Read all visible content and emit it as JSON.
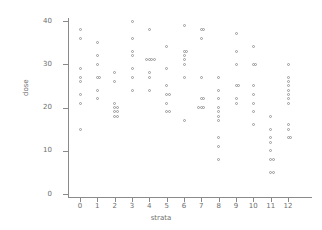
{
  "chart_data": {
    "type": "scatter",
    "title": "",
    "xlabel": "strata",
    "ylabel": "dose",
    "xlim": [
      -0.6,
      12.8
    ],
    "ylim": [
      0,
      42
    ],
    "xticks": [
      0,
      1,
      2,
      3,
      4,
      5,
      6,
      7,
      8,
      9,
      10,
      11,
      12
    ],
    "yticks": [
      0,
      10,
      20,
      30,
      40
    ],
    "xtick_labels": [
      "0",
      "1",
      "2",
      "3",
      "4",
      "5",
      "6",
      "7",
      "8",
      "9",
      "10",
      "11",
      "12"
    ],
    "ytick_labels": [
      "0",
      "10",
      "20",
      "30",
      "40"
    ],
    "grid": false,
    "legend": false,
    "marker": "open-circle",
    "marker_color": "#9a9a9a",
    "axis_color": "#8a8a8a",
    "series": [
      {
        "name": "dose by strata",
        "points": [
          {
            "x": 0,
            "y": 38
          },
          {
            "x": 0,
            "y": 36
          },
          {
            "x": 0,
            "y": 29
          },
          {
            "x": 0,
            "y": 27
          },
          {
            "x": 0,
            "y": 26
          },
          {
            "x": 0,
            "y": 23
          },
          {
            "x": 0,
            "y": 21
          },
          {
            "x": 0,
            "y": 15
          },
          {
            "x": 1,
            "y": 35
          },
          {
            "x": 1,
            "y": 32
          },
          {
            "x": 1,
            "y": 30
          },
          {
            "x": 1,
            "y": 27
          },
          {
            "x": 1,
            "y": 27
          },
          {
            "x": 1,
            "y": 24
          },
          {
            "x": 1,
            "y": 22
          },
          {
            "x": 2,
            "y": 28
          },
          {
            "x": 2,
            "y": 26
          },
          {
            "x": 2,
            "y": 21
          },
          {
            "x": 2,
            "y": 20
          },
          {
            "x": 2,
            "y": 20
          },
          {
            "x": 2,
            "y": 19
          },
          {
            "x": 2,
            "y": 19
          },
          {
            "x": 2,
            "y": 18
          },
          {
            "x": 2,
            "y": 18
          },
          {
            "x": 3,
            "y": 40
          },
          {
            "x": 3,
            "y": 36
          },
          {
            "x": 3,
            "y": 33
          },
          {
            "x": 3,
            "y": 32
          },
          {
            "x": 3,
            "y": 29
          },
          {
            "x": 3,
            "y": 27
          },
          {
            "x": 3,
            "y": 24
          },
          {
            "x": 4,
            "y": 38
          },
          {
            "x": 4,
            "y": 31
          },
          {
            "x": 4,
            "y": 31
          },
          {
            "x": 4,
            "y": 31
          },
          {
            "x": 4,
            "y": 31
          },
          {
            "x": 4,
            "y": 28
          },
          {
            "x": 4,
            "y": 27
          },
          {
            "x": 4,
            "y": 24
          },
          {
            "x": 5,
            "y": 34
          },
          {
            "x": 5,
            "y": 29
          },
          {
            "x": 5,
            "y": 25
          },
          {
            "x": 5,
            "y": 23
          },
          {
            "x": 5,
            "y": 23
          },
          {
            "x": 5,
            "y": 21
          },
          {
            "x": 5,
            "y": 19
          },
          {
            "x": 5,
            "y": 19
          },
          {
            "x": 6,
            "y": 39
          },
          {
            "x": 6,
            "y": 33
          },
          {
            "x": 6,
            "y": 33
          },
          {
            "x": 6,
            "y": 32
          },
          {
            "x": 6,
            "y": 31
          },
          {
            "x": 6,
            "y": 30
          },
          {
            "x": 6,
            "y": 27
          },
          {
            "x": 6,
            "y": 17
          },
          {
            "x": 7,
            "y": 38
          },
          {
            "x": 7,
            "y": 38
          },
          {
            "x": 7,
            "y": 36
          },
          {
            "x": 7,
            "y": 27
          },
          {
            "x": 7,
            "y": 22
          },
          {
            "x": 7,
            "y": 22
          },
          {
            "x": 7,
            "y": 20
          },
          {
            "x": 7,
            "y": 20
          },
          {
            "x": 7,
            "y": 20
          },
          {
            "x": 8,
            "y": 27
          },
          {
            "x": 8,
            "y": 24
          },
          {
            "x": 8,
            "y": 22
          },
          {
            "x": 8,
            "y": 20
          },
          {
            "x": 8,
            "y": 19
          },
          {
            "x": 8,
            "y": 18
          },
          {
            "x": 8,
            "y": 17
          },
          {
            "x": 8,
            "y": 13
          },
          {
            "x": 8,
            "y": 11
          },
          {
            "x": 8,
            "y": 8
          },
          {
            "x": 9,
            "y": 37
          },
          {
            "x": 9,
            "y": 33
          },
          {
            "x": 9,
            "y": 30
          },
          {
            "x": 9,
            "y": 25
          },
          {
            "x": 9,
            "y": 25
          },
          {
            "x": 9,
            "y": 22
          },
          {
            "x": 9,
            "y": 21
          },
          {
            "x": 10,
            "y": 34
          },
          {
            "x": 10,
            "y": 30
          },
          {
            "x": 10,
            "y": 30
          },
          {
            "x": 10,
            "y": 25
          },
          {
            "x": 10,
            "y": 23
          },
          {
            "x": 10,
            "y": 21
          },
          {
            "x": 10,
            "y": 19
          },
          {
            "x": 10,
            "y": 16
          },
          {
            "x": 11,
            "y": 18
          },
          {
            "x": 11,
            "y": 15
          },
          {
            "x": 11,
            "y": 13
          },
          {
            "x": 11,
            "y": 12
          },
          {
            "x": 11,
            "y": 10
          },
          {
            "x": 11,
            "y": 8
          },
          {
            "x": 11,
            "y": 8
          },
          {
            "x": 11,
            "y": 5
          },
          {
            "x": 11,
            "y": 5
          },
          {
            "x": 12,
            "y": 30
          },
          {
            "x": 12,
            "y": 27
          },
          {
            "x": 12,
            "y": 26
          },
          {
            "x": 12,
            "y": 25
          },
          {
            "x": 12,
            "y": 24
          },
          {
            "x": 12,
            "y": 23
          },
          {
            "x": 12,
            "y": 22
          },
          {
            "x": 12,
            "y": 21
          },
          {
            "x": 12,
            "y": 16
          },
          {
            "x": 12,
            "y": 15
          },
          {
            "x": 12,
            "y": 13
          },
          {
            "x": 12,
            "y": 13
          }
        ]
      }
    ]
  }
}
